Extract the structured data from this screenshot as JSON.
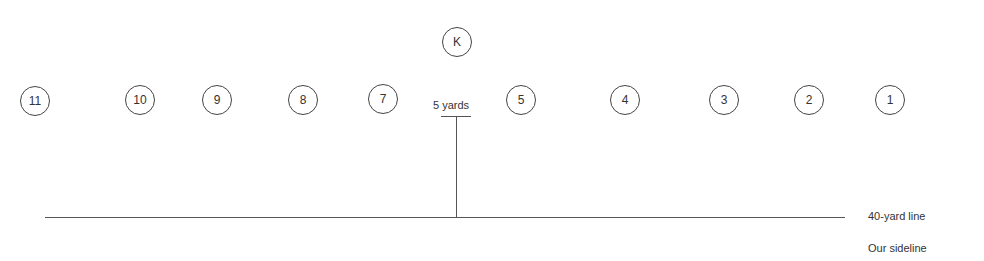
{
  "diagram": {
    "kicker": {
      "label": "K",
      "x": 457,
      "y": 42
    },
    "players": [
      {
        "label": "11",
        "x": 35,
        "y": 101
      },
      {
        "label": "10",
        "x": 140,
        "y": 100
      },
      {
        "label": "9",
        "x": 217,
        "y": 100
      },
      {
        "label": "8",
        "x": 303,
        "y": 100
      },
      {
        "label": "7",
        "x": 383,
        "y": 99
      },
      {
        "label": "5",
        "x": 521,
        "y": 100
      },
      {
        "label": "4",
        "x": 625,
        "y": 100
      },
      {
        "label": "3",
        "x": 724,
        "y": 100
      },
      {
        "label": "2",
        "x": 809,
        "y": 100
      },
      {
        "label": "1",
        "x": 890,
        "y": 100
      }
    ],
    "distance_label": "5 yards",
    "line_label": "40-yard line",
    "sideline_label": "Our sideline"
  }
}
